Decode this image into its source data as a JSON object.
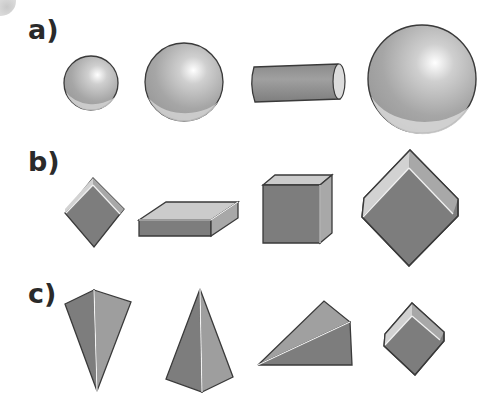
{
  "rows": [
    {
      "label": "a)",
      "shapes": [
        "sphere-small",
        "sphere-medium",
        "cylinder",
        "sphere-large"
      ]
    },
    {
      "label": "b)",
      "shapes": [
        "cube-tilted-small",
        "cuboid-flat",
        "cube",
        "cube-tilted-large"
      ]
    },
    {
      "label": "c)",
      "shapes": [
        "tetrahedron-inverted",
        "square-pyramid",
        "triangular-prism-wedge",
        "cube-tilted-small"
      ]
    }
  ],
  "colors": {
    "face_dark": "#7d7d7d",
    "face_mid": "#9a9a9a",
    "face_light": "#c8c8c8",
    "outline": "#3a3a3a",
    "highlight": "#f2f2f2"
  }
}
